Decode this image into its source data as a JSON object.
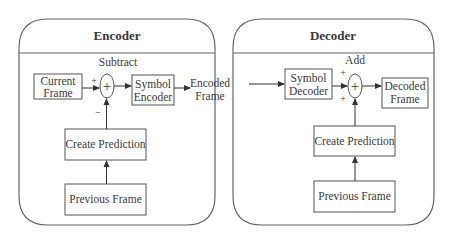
{
  "encoder": {
    "title": "Encoder",
    "op_label": "Subtract",
    "current_frame": [
      "Current",
      "Frame"
    ],
    "symbol_encoder": [
      "Symbol",
      "Encoder"
    ],
    "create_prediction": "Create Prediction",
    "previous_frame": "Previous Frame",
    "adder_symbol": "+",
    "sign_top": "+",
    "sign_bottom": "−"
  },
  "link": {
    "encoded_frame": [
      "Encoded",
      "Frame"
    ]
  },
  "decoder": {
    "title": "Decoder",
    "op_label": "Add",
    "symbol_decoder": [
      "Symbol",
      "Decoder"
    ],
    "decoded_frame": [
      "Decoded",
      "Frame"
    ],
    "create_prediction": "Create Prediction",
    "previous_frame": "Previous Frame",
    "adder_symbol": "+",
    "sign_top": "+",
    "sign_bottom": "+"
  },
  "colors": {
    "stroke": "#555555",
    "text": "#3a3a3a",
    "background": "#ffffff"
  }
}
